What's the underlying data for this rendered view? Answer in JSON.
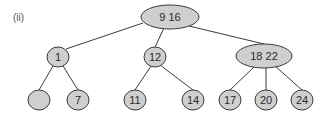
{
  "panel_label": "(ii)",
  "tree": {
    "type": "2-3 tree",
    "nodes": [
      {
        "id": "root",
        "keys": [
          "9",
          "16"
        ],
        "parent": null
      },
      {
        "id": "n1",
        "keys": [
          "1"
        ],
        "parent": "root"
      },
      {
        "id": "n12",
        "keys": [
          "12"
        ],
        "parent": "root"
      },
      {
        "id": "n18_22",
        "keys": [
          "18",
          "22"
        ],
        "parent": "root"
      },
      {
        "id": "leaf_empty",
        "keys": [],
        "parent": "n1"
      },
      {
        "id": "leaf7",
        "keys": [
          "7"
        ],
        "parent": "n1"
      },
      {
        "id": "leaf11",
        "keys": [
          "11"
        ],
        "parent": "n12"
      },
      {
        "id": "leaf14",
        "keys": [
          "14"
        ],
        "parent": "n12"
      },
      {
        "id": "leaf17",
        "keys": [
          "17"
        ],
        "parent": "n18_22"
      },
      {
        "id": "leaf20",
        "keys": [
          "20"
        ],
        "parent": "n18_22"
      },
      {
        "id": "leaf24",
        "keys": [
          "24"
        ],
        "parent": "n18_22"
      }
    ]
  },
  "colors": {
    "node_fill": "#cfcfcf",
    "node_stroke": "#3a3a3a",
    "edge": "#3a3a3a",
    "text": "#2a2a2a"
  }
}
